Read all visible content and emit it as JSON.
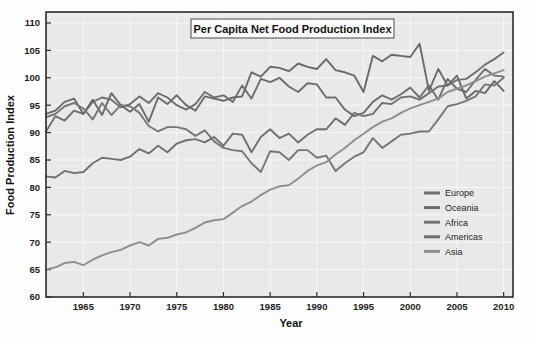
{
  "chart_data": {
    "type": "line",
    "title": "Per Capita Net Food Production Index",
    "xlabel": "Year",
    "ylabel": "Food Production Index",
    "xlim": [
      1961,
      2011
    ],
    "ylim": [
      60,
      112
    ],
    "xticks": [
      1965,
      1970,
      1975,
      1980,
      1985,
      1990,
      1995,
      2000,
      2005,
      2010
    ],
    "yticks": [
      60,
      65,
      70,
      75,
      80,
      85,
      90,
      95,
      100,
      105,
      110
    ],
    "grid": true,
    "legend_position": "right-lower",
    "x": [
      1961,
      1962,
      1963,
      1964,
      1965,
      1966,
      1967,
      1968,
      1969,
      1970,
      1971,
      1972,
      1973,
      1974,
      1975,
      1976,
      1977,
      1978,
      1979,
      1980,
      1981,
      1982,
      1983,
      1984,
      1985,
      1986,
      1987,
      1988,
      1989,
      1990,
      1991,
      1992,
      1993,
      1994,
      1995,
      1996,
      1997,
      1998,
      1999,
      2000,
      2001,
      2002,
      2003,
      2004,
      2005,
      2006,
      2007,
      2008,
      2009,
      2010
    ],
    "series": [
      {
        "name": "Europe",
        "color": "#6e6e6e",
        "values": [
          90.2,
          93.0,
          92.2,
          94.0,
          93.4,
          95.6,
          96.4,
          96.0,
          94.6,
          95.2,
          96.6,
          95.4,
          97.2,
          96.4,
          95.0,
          94.2,
          95.2,
          97.4,
          96.4,
          96.8,
          95.6,
          98.6,
          96.2,
          99.8,
          99.2,
          100.0,
          98.4,
          97.4,
          99.0,
          98.8,
          96.4,
          96.4,
          94.2,
          93.0,
          93.6,
          95.6,
          96.8,
          96.0,
          97.0,
          98.2,
          96.4,
          98.6,
          96.0,
          99.8,
          98.0,
          97.4,
          99.6,
          101.6,
          100.4,
          100.2
        ]
      },
      {
        "name": "Oceania",
        "color": "#6a6a6a",
        "values": [
          93.4,
          94.0,
          95.6,
          96.2,
          93.4,
          96.0,
          93.2,
          97.2,
          95.0,
          93.8,
          95.2,
          92.0,
          96.4,
          95.2,
          96.8,
          95.0,
          94.0,
          96.6,
          96.2,
          95.8,
          96.4,
          96.6,
          101.0,
          100.2,
          102.0,
          101.8,
          101.2,
          102.6,
          102.0,
          101.6,
          103.4,
          101.4,
          101.0,
          100.4,
          97.4,
          104.0,
          103.0,
          104.2,
          104.0,
          103.8,
          106.2,
          97.6,
          101.6,
          98.6,
          100.4,
          96.2,
          97.6,
          97.2,
          99.4,
          97.6
        ]
      },
      {
        "name": "Africa",
        "color": "#767676",
        "values": [
          92.8,
          93.4,
          94.8,
          95.4,
          94.4,
          92.4,
          95.4,
          93.2,
          95.0,
          94.8,
          93.6,
          91.2,
          90.2,
          91.0,
          91.0,
          90.6,
          89.4,
          90.4,
          88.4,
          87.2,
          86.8,
          86.6,
          84.4,
          82.8,
          86.6,
          86.4,
          85.0,
          86.8,
          86.8,
          85.4,
          85.8,
          83.0,
          84.4,
          85.6,
          86.4,
          89.0,
          87.2,
          88.4,
          89.6,
          89.8,
          90.2,
          90.2,
          92.4,
          94.8,
          95.2,
          95.8,
          96.6,
          98.8,
          98.6,
          100.0
        ]
      },
      {
        "name": "Americas",
        "color": "#707070",
        "values": [
          82.0,
          81.8,
          83.0,
          82.6,
          82.8,
          84.4,
          85.4,
          85.2,
          85.0,
          85.6,
          87.0,
          86.2,
          87.6,
          86.4,
          88.0,
          88.6,
          88.8,
          88.2,
          89.2,
          87.6,
          89.8,
          89.6,
          86.4,
          89.2,
          90.6,
          89.0,
          89.8,
          88.2,
          89.6,
          90.6,
          90.6,
          92.6,
          91.4,
          93.6,
          93.0,
          93.4,
          95.4,
          95.2,
          96.4,
          96.6,
          96.0,
          97.2,
          98.4,
          98.6,
          99.6,
          99.8,
          101.0,
          102.4,
          103.4,
          104.6
        ]
      },
      {
        "name": "Asia",
        "color": "#8e8e8e",
        "values": [
          65.0,
          65.4,
          66.2,
          66.4,
          65.8,
          66.8,
          67.6,
          68.2,
          68.6,
          69.4,
          70.0,
          69.4,
          70.6,
          70.8,
          71.4,
          71.8,
          72.6,
          73.6,
          74.0,
          74.2,
          75.4,
          76.6,
          77.4,
          78.6,
          79.6,
          80.2,
          80.4,
          81.6,
          83.0,
          84.0,
          84.6,
          86.0,
          87.2,
          88.6,
          89.8,
          91.0,
          92.0,
          92.6,
          93.6,
          94.4,
          95.0,
          95.6,
          96.2,
          97.4,
          98.0,
          98.6,
          99.4,
          100.2,
          100.8,
          101.4
        ]
      }
    ]
  },
  "legend": {
    "entries": [
      {
        "label": "Europe"
      },
      {
        "label": "Oceania"
      },
      {
        "label": "Africa"
      },
      {
        "label": "Americas"
      },
      {
        "label": "Asia"
      }
    ]
  }
}
